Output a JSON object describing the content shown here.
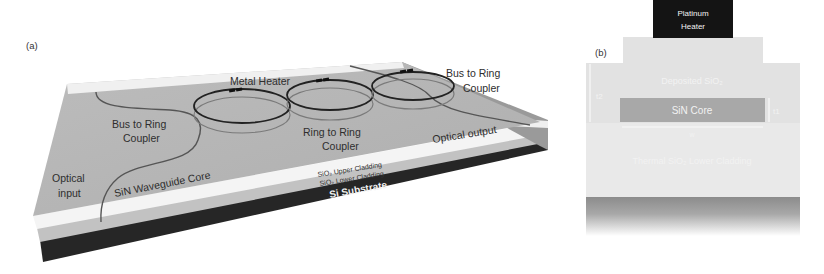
{
  "figure": {
    "panel_a": {
      "label": "(a)",
      "labels": {
        "metal_heater": "Metal Heater",
        "bus_to_ring_left_1": "Bus to Ring",
        "bus_to_ring_left_2": "Coupler",
        "bus_to_ring_right_1": "Bus to Ring",
        "bus_to_ring_right_2": "Coupler",
        "ring_to_ring_1": "Ring to Ring",
        "ring_to_ring_2": "Coupler",
        "optical_output": "Optical output",
        "optical_input_1": "Optical",
        "optical_input_2": "input",
        "waveguide_core": "SiN Waveguide Core",
        "upper_cladding": "SiO₂ Upper Cladding",
        "lower_cladding": "SiO₂ Lower Cladding",
        "substrate": "Si Substrate"
      },
      "ring_count": 3
    },
    "panel_b": {
      "label": "(b)",
      "heater_1": "Platinum",
      "heater_2": "Heater",
      "deposited": "Deposited SiO₂",
      "core": "SiN Core",
      "lower_cladding": "Thermal SiO₂ Lower Cladding",
      "dim_left": "t2",
      "dim_right": "t1",
      "dim_bottom": "w"
    },
    "colors": {
      "chip_top": "#b4b4b4",
      "cladding_white": "#f4f4f4",
      "substrate": "#2a2a2a",
      "heater_box": "#141414",
      "oxide_light": "#e6e6e6",
      "core_gray": "#a6a6a6"
    }
  }
}
